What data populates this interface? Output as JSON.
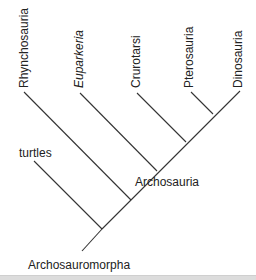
{
  "diagram": {
    "type": "cladogram",
    "taxa": [
      {
        "id": "rhynchosauria",
        "label": "Rhynchosauria",
        "italic": false
      },
      {
        "id": "euparkeria",
        "label": "Euparkeria",
        "italic": true
      },
      {
        "id": "crurotarsi",
        "label": "Crurotarsi",
        "italic": false
      },
      {
        "id": "pterosauria",
        "label": "Pterosauria",
        "italic": false
      },
      {
        "id": "dinosauria",
        "label": "Dinosauria",
        "italic": false
      },
      {
        "id": "turtles",
        "label": "turtles",
        "italic": false
      }
    ],
    "clades": [
      {
        "id": "archosauria",
        "label": "Archosauria",
        "members": [
          "crurotarsi",
          "pterosauria",
          "dinosauria"
        ]
      },
      {
        "id": "archosauromorpha",
        "label": "Archosauromorpha",
        "members": [
          "turtles",
          "rhynchosauria",
          "euparkeria",
          "crurotarsi",
          "pterosauria",
          "dinosauria"
        ]
      }
    ],
    "topology": "(turtles,(Rhynchosauria,(Euparkeria,(Crurotarsi,(Pterosauria,Dinosauria)))))",
    "colors": {
      "line": "#333333",
      "text": "#222222",
      "background": "#ffffff"
    }
  }
}
